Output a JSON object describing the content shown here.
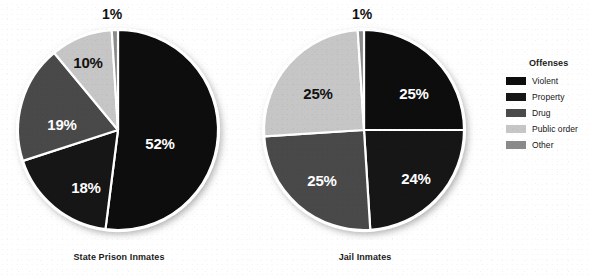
{
  "chart_data": [
    {
      "type": "pie",
      "title": "State Prison Inmates",
      "categories": [
        "Violent",
        "Property",
        "Drug",
        "Public order",
        "Other"
      ],
      "values": [
        52,
        18,
        19,
        10,
        1
      ],
      "labels": [
        "52%",
        "18%",
        "19%",
        "10%",
        "1%"
      ],
      "colors": [
        "#080808",
        "#161616",
        "#4a4a4a",
        "#c6c6c6",
        "#8a8a8a"
      ],
      "legend_position": "right",
      "units": "percent"
    },
    {
      "type": "pie",
      "title": "Jail Inmates",
      "categories": [
        "Violent",
        "Property",
        "Drug",
        "Public order",
        "Other"
      ],
      "values": [
        25,
        24,
        25,
        25,
        1
      ],
      "labels": [
        "25%",
        "24%",
        "25%",
        "25%",
        "1%"
      ],
      "colors": [
        "#080808",
        "#161616",
        "#4a4a4a",
        "#c6c6c6",
        "#8a8a8a"
      ],
      "legend_position": "right",
      "units": "percent"
    }
  ],
  "charts": [
    {
      "caption": "State Prison Inmates",
      "slices": [
        {
          "category": "Violent",
          "value": 52,
          "label": "52%",
          "color": "#080808",
          "label_x": 156,
          "label_y": 143,
          "label_tone": "on-dark"
        },
        {
          "category": "Property",
          "value": 18,
          "label": "18%",
          "color": "#161616",
          "label_x": 82,
          "label_y": 187,
          "label_tone": "on-dark"
        },
        {
          "category": "Drug",
          "value": 19,
          "label": "19%",
          "color": "#4a4a4a",
          "label_x": 58,
          "label_y": 124,
          "label_tone": "on-dark"
        },
        {
          "category": "Public order",
          "value": 10,
          "label": "10%",
          "color": "#c6c6c6",
          "label_x": 84,
          "label_y": 62,
          "label_tone": "on-light"
        },
        {
          "category": "Other",
          "value": 1,
          "label": "1%",
          "color": "#8a8a8a",
          "label_x": 108,
          "label_y": 14,
          "label_tone": "outside"
        }
      ]
    },
    {
      "caption": "Jail Inmates",
      "slices": [
        {
          "category": "Violent",
          "value": 25,
          "label": "25%",
          "color": "#080808",
          "label_x": 164,
          "label_y": 93,
          "label_tone": "on-dark"
        },
        {
          "category": "Property",
          "value": 24,
          "label": "24%",
          "color": "#161616",
          "label_x": 166,
          "label_y": 178,
          "label_tone": "on-dark"
        },
        {
          "category": "Drug",
          "value": 25,
          "label": "25%",
          "color": "#4a4a4a",
          "label_x": 72,
          "label_y": 180,
          "label_tone": "on-dark"
        },
        {
          "category": "Public order",
          "value": 25,
          "label": "25%",
          "color": "#c6c6c6",
          "label_x": 68,
          "label_y": 93,
          "label_tone": "on-light"
        },
        {
          "category": "Other",
          "value": 1,
          "label": "1%",
          "color": "#8a8a8a",
          "label_x": 112,
          "label_y": 14,
          "label_tone": "outside"
        }
      ]
    }
  ],
  "legend": {
    "title": "Offenses",
    "items": [
      {
        "label": "Violent",
        "color": "#0d0d0d"
      },
      {
        "label": "Property",
        "color": "#161616"
      },
      {
        "label": "Drug",
        "color": "#4a4a4a"
      },
      {
        "label": "Public order",
        "color": "#c6c6c6"
      },
      {
        "label": "Other",
        "color": "#8a8a8a"
      }
    ]
  }
}
